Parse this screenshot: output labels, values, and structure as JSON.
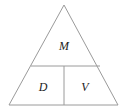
{
  "diagram": {
    "type": "formula-triangle",
    "top_label": "M",
    "bottom_left_label": "D",
    "bottom_right_label": "V",
    "line_color": "#9a9a9a"
  }
}
